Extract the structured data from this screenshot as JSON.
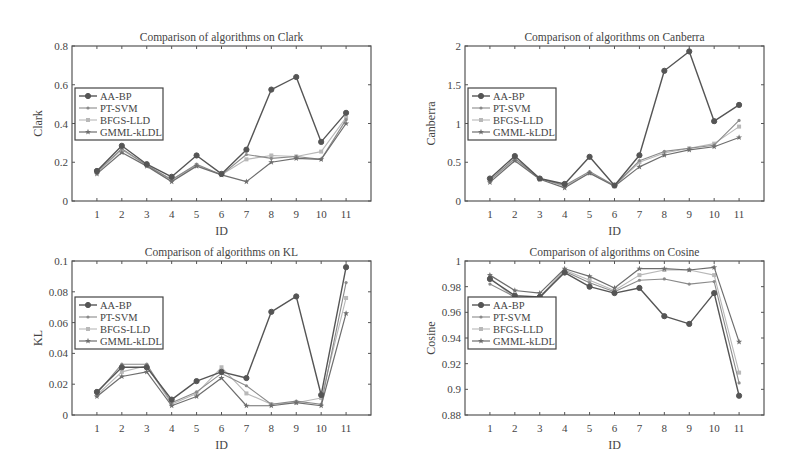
{
  "figure": {
    "legend_labels": [
      "AA-BP",
      "PT-SVM",
      "BFGS-LLD",
      "GMML-kLDL"
    ],
    "series_styles": [
      {
        "name": "AA-BP",
        "color": "#555555",
        "marker": "circle",
        "width": 1.4
      },
      {
        "name": "PT-SVM",
        "color": "#8a8a8a",
        "marker": "dot",
        "width": 1.1
      },
      {
        "name": "BFGS-LLD",
        "color": "#b8b8b8",
        "marker": "square",
        "width": 1.1
      },
      {
        "name": "GMML-kLDL",
        "color": "#6e6e6e",
        "marker": "star",
        "width": 1.2
      }
    ]
  },
  "chart_data": [
    {
      "type": "line",
      "title": "Comparison of algorithms on Clark",
      "xlabel": "ID",
      "ylabel": "Clark",
      "x": [
        1,
        2,
        3,
        4,
        5,
        6,
        7,
        8,
        9,
        10,
        11
      ],
      "xlim": [
        0,
        12
      ],
      "ylim": [
        0,
        0.8
      ],
      "yticks": [
        0,
        0.2,
        0.4,
        0.6,
        0.8
      ],
      "ytick_labels": [
        "0",
        "0.2",
        "0.4",
        "0.6",
        "0.8"
      ],
      "legend_position": "left-middle",
      "grid": false,
      "series": [
        {
          "name": "AA-BP",
          "values": [
            0.155,
            0.285,
            0.19,
            0.125,
            0.235,
            0.14,
            0.265,
            0.575,
            0.64,
            0.305,
            0.455
          ]
        },
        {
          "name": "PT-SVM",
          "values": [
            0.15,
            0.27,
            0.185,
            0.11,
            0.19,
            0.135,
            0.24,
            0.22,
            0.23,
            0.215,
            0.42
          ]
        },
        {
          "name": "BFGS-LLD",
          "values": [
            0.145,
            0.265,
            0.185,
            0.11,
            0.185,
            0.135,
            0.215,
            0.235,
            0.23,
            0.255,
            0.43
          ]
        },
        {
          "name": "GMML-kLDL",
          "values": [
            0.14,
            0.25,
            0.18,
            0.1,
            0.18,
            0.135,
            0.1,
            0.2,
            0.22,
            0.215,
            0.4
          ]
        }
      ]
    },
    {
      "type": "line",
      "title": "Comparison of algorithms on Canberra",
      "xlabel": "ID",
      "ylabel": "Canberra",
      "x": [
        1,
        2,
        3,
        4,
        5,
        6,
        7,
        8,
        9,
        10,
        11
      ],
      "xlim": [
        0,
        12
      ],
      "ylim": [
        0,
        2
      ],
      "yticks": [
        0,
        0.5,
        1,
        1.5,
        2
      ],
      "ytick_labels": [
        "0",
        "0.5",
        "1",
        "1.5",
        "2"
      ],
      "legend_position": "left-middle",
      "grid": false,
      "series": [
        {
          "name": "AA-BP",
          "values": [
            0.29,
            0.58,
            0.29,
            0.22,
            0.57,
            0.2,
            0.59,
            1.68,
            1.93,
            1.03,
            1.24
          ]
        },
        {
          "name": "PT-SVM",
          "values": [
            0.27,
            0.55,
            0.29,
            0.2,
            0.38,
            0.2,
            0.52,
            0.64,
            0.68,
            0.72,
            1.04
          ]
        },
        {
          "name": "BFGS-LLD",
          "values": [
            0.26,
            0.54,
            0.29,
            0.19,
            0.36,
            0.2,
            0.5,
            0.62,
            0.68,
            0.74,
            0.96
          ]
        },
        {
          "name": "GMML-kLDL",
          "values": [
            0.24,
            0.52,
            0.28,
            0.17,
            0.36,
            0.19,
            0.44,
            0.59,
            0.66,
            0.7,
            0.82
          ]
        }
      ]
    },
    {
      "type": "line",
      "title": "Comparison of algorithms on KL",
      "xlabel": "ID",
      "ylabel": "KL",
      "x": [
        1,
        2,
        3,
        4,
        5,
        6,
        7,
        8,
        9,
        10,
        11
      ],
      "xlim": [
        0,
        12
      ],
      "ylim": [
        0,
        0.1
      ],
      "yticks": [
        0,
        0.02,
        0.04,
        0.06,
        0.08,
        0.1
      ],
      "ytick_labels": [
        "0",
        "0.02",
        "0.04",
        "0.06",
        "0.08",
        "0.1"
      ],
      "legend_position": "left-middle",
      "grid": false,
      "series": [
        {
          "name": "AA-BP",
          "values": [
            0.015,
            0.031,
            0.031,
            0.01,
            0.022,
            0.028,
            0.024,
            0.067,
            0.077,
            0.013,
            0.096
          ]
        },
        {
          "name": "PT-SVM",
          "values": [
            0.014,
            0.033,
            0.033,
            0.008,
            0.015,
            0.027,
            0.019,
            0.007,
            0.009,
            0.007,
            0.086
          ]
        },
        {
          "name": "BFGS-LLD",
          "values": [
            0.013,
            0.028,
            0.032,
            0.007,
            0.014,
            0.031,
            0.014,
            0.007,
            0.008,
            0.011,
            0.076
          ]
        },
        {
          "name": "GMML-kLDL",
          "values": [
            0.012,
            0.025,
            0.028,
            0.006,
            0.012,
            0.024,
            0.006,
            0.006,
            0.008,
            0.006,
            0.066
          ]
        }
      ]
    },
    {
      "type": "line",
      "title": "Comparison of algorithms on Cosine",
      "xlabel": "ID",
      "ylabel": "Cosine",
      "x": [
        1,
        2,
        3,
        4,
        5,
        6,
        7,
        8,
        9,
        10,
        11
      ],
      "xlim": [
        0,
        12
      ],
      "ylim": [
        0.88,
        1
      ],
      "yticks": [
        0.88,
        0.9,
        0.92,
        0.94,
        0.96,
        0.98,
        1
      ],
      "ytick_labels": [
        "0.88",
        "0.9",
        "0.92",
        "0.94",
        "0.96",
        "0.98",
        "1"
      ],
      "legend_position": "left-middle",
      "grid": false,
      "series": [
        {
          "name": "AA-BP",
          "values": [
            0.986,
            0.973,
            0.972,
            0.991,
            0.98,
            0.975,
            0.979,
            0.957,
            0.951,
            0.975,
            0.895
          ]
        },
        {
          "name": "PT-SVM",
          "values": [
            0.982,
            0.972,
            0.971,
            0.992,
            0.983,
            0.976,
            0.985,
            0.986,
            0.982,
            0.984,
            0.905
          ]
        },
        {
          "name": "BFGS-LLD",
          "values": [
            0.987,
            0.971,
            0.972,
            0.993,
            0.985,
            0.977,
            0.989,
            0.993,
            0.993,
            0.989,
            0.913
          ]
        },
        {
          "name": "GMML-kLDL",
          "values": [
            0.989,
            0.977,
            0.975,
            0.994,
            0.988,
            0.979,
            0.994,
            0.994,
            0.993,
            0.995,
            0.937
          ]
        }
      ]
    }
  ],
  "panels": [
    {
      "x0": 72,
      "y0": 46,
      "x1": 371,
      "y1": 201
    },
    {
      "x0": 465,
      "y0": 46,
      "x1": 764,
      "y1": 201
    },
    {
      "x0": 72,
      "y0": 261,
      "x1": 371,
      "y1": 415
    },
    {
      "x0": 465,
      "y0": 261,
      "x1": 764,
      "y1": 415
    }
  ]
}
